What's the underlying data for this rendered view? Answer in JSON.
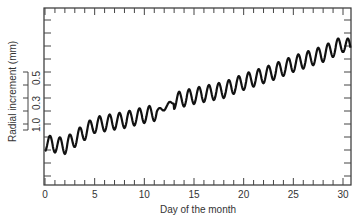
{
  "chart_data": {
    "type": "line",
    "title": "",
    "xlabel": "Day of the month",
    "ylabel": "Radial increment  (mm)",
    "xlim": [
      0,
      30.8
    ],
    "x_ticks": [
      0,
      5,
      10,
      15,
      20,
      25,
      30
    ],
    "x_tick_labels": [
      "0",
      "5",
      "10",
      "15",
      "20",
      "25",
      "30"
    ],
    "x_minor_tick_step": 1,
    "y_axis_numeric_labels": false,
    "scale_bar": {
      "labels": [
        "1.0",
        "0.3",
        "0.5"
      ],
      "unit": "mm",
      "note": "vertical scale bar with tick marks left of plot"
    },
    "grid": false,
    "legend": null,
    "series": [
      {
        "name": "Radial increment",
        "description": "Rising trend with daily (diurnal) oscillation, about one cycle per day",
        "trend_x": [
          0,
          2,
          5,
          8,
          10,
          11,
          12,
          13,
          15,
          18,
          20,
          23,
          25,
          28,
          30,
          30.8
        ],
        "trend_y_px": [
          143,
          146,
          125,
          120,
          115,
          113,
          108,
          101,
          96,
          90,
          82,
          72,
          64,
          54,
          44,
          48
        ],
        "amplitude_px": 8,
        "period_days": 1.0
      }
    ],
    "plot_area_px": {
      "left": 44,
      "top": 8,
      "right": 351,
      "bottom": 185
    },
    "y_tick_px": [
      20,
      33,
      46,
      59,
      72,
      85,
      98,
      111,
      124,
      137,
      150,
      163,
      176
    ]
  }
}
